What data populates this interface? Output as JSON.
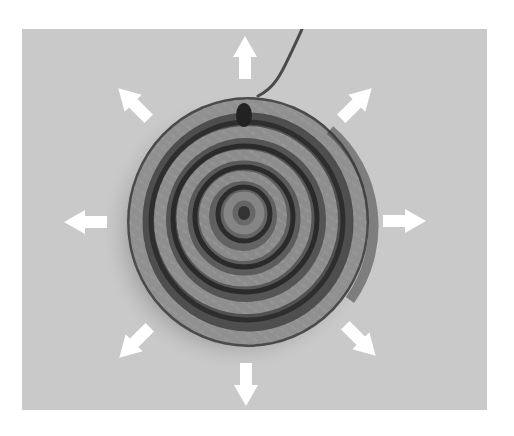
{
  "figure": {
    "subject": "Crocheted flat circle worked in a spiral, with arrows showing outward expansion",
    "colors": {
      "page_background": "#ffffff",
      "photo_background": "#c9c9c9",
      "arrow": "#ffffff",
      "yarn_dark": "#2a2a2a",
      "yarn_mid": "#6e6e6e",
      "yarn_light": "#a8a8a8"
    },
    "arrows": [
      {
        "direction": "up",
        "icon": "arrow-up-icon"
      },
      {
        "direction": "up-right",
        "icon": "arrow-up-right-icon"
      },
      {
        "direction": "right",
        "icon": "arrow-right-icon"
      },
      {
        "direction": "down-right",
        "icon": "arrow-down-right-icon"
      },
      {
        "direction": "down",
        "icon": "arrow-down-icon"
      },
      {
        "direction": "down-left",
        "icon": "arrow-down-left-icon"
      },
      {
        "direction": "left",
        "icon": "arrow-left-icon"
      },
      {
        "direction": "up-left",
        "icon": "arrow-up-left-icon"
      }
    ],
    "arrow_count": 8
  }
}
